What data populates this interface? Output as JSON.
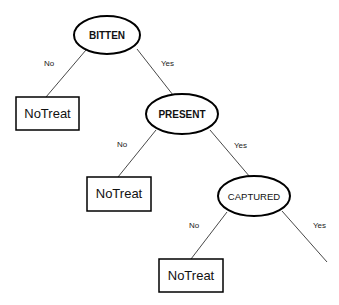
{
  "diagram": {
    "type": "decision-tree",
    "nodes": [
      {
        "id": "bitten",
        "label": "BITTEN",
        "shape": "ellipse"
      },
      {
        "id": "present",
        "label": "PRESENT",
        "shape": "ellipse"
      },
      {
        "id": "captured",
        "label": "CAPTURED",
        "shape": "ellipse"
      },
      {
        "id": "leaf1",
        "label": "NoTreat",
        "shape": "rectangle"
      },
      {
        "id": "leaf2",
        "label": "NoTreat",
        "shape": "rectangle"
      },
      {
        "id": "leaf3",
        "label": "NoTreat",
        "shape": "rectangle"
      }
    ],
    "edges": [
      {
        "from": "bitten",
        "to": "leaf1",
        "label": "No"
      },
      {
        "from": "bitten",
        "to": "present",
        "label": "Yes"
      },
      {
        "from": "present",
        "to": "leaf2",
        "label": "No"
      },
      {
        "from": "present",
        "to": "captured",
        "label": "Yes"
      },
      {
        "from": "captured",
        "to": "leaf3",
        "label": "No"
      },
      {
        "from": "captured",
        "to": "(off-canvas)",
        "label": "Yes"
      }
    ]
  },
  "colors": {
    "stroke": "#000000",
    "background": "#ffffff",
    "text": "#111111"
  }
}
